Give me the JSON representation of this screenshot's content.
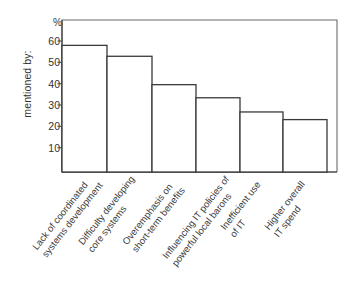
{
  "chart_data": {
    "type": "bar",
    "title": "",
    "subtitle": "",
    "xlabel": "",
    "ylabel": "mentioned by:",
    "unit_symbol": "%",
    "ylim": [
      0,
      65
    ],
    "yticks": [
      10,
      20,
      30,
      40,
      50,
      60
    ],
    "ytick_labels": [
      "10",
      "20",
      "30",
      "40",
      "50",
      "60"
    ],
    "grid": false,
    "legend": null,
    "categories": [
      "Lack of coordinated systems development",
      "Difficulty developing core systems",
      "Overemphasis on short-term benefits",
      "Influencing IT policies of powerful local barons",
      "Inefficient use of IT",
      "Higher overall IT spend"
    ],
    "category_lines": [
      [
        "Lack of coordinated",
        "systems development"
      ],
      [
        "Difficulty developing",
        "core systems"
      ],
      [
        "Overemphasis on",
        "short-term benefits"
      ],
      [
        "Influencing IT policies of",
        "powerful local barons"
      ],
      [
        "Inefficient use",
        "of IT"
      ],
      [
        "Higher overall",
        "IT spend"
      ]
    ],
    "values": [
      58,
      53,
      40,
      34,
      27.5,
      24
    ],
    "bar_color": "#ffffff",
    "bar_edge_color": "#3a3a3a",
    "axis_color": "#4a4a4a"
  }
}
